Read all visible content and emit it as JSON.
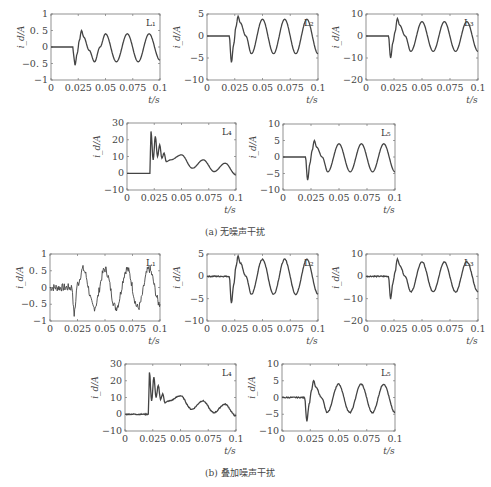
{
  "figure": {
    "caption_a": "(a) 无噪声干扰",
    "caption_b": "(b) 叠加噪声干扰",
    "ylabel": "i_d/A",
    "xlabel": "t/s",
    "x_ticks": [
      "0",
      "0.025",
      "0.05",
      "0.075",
      "0.1"
    ]
  },
  "chart_data": [
    {
      "panel": "a",
      "name": "L1",
      "type": "line",
      "title": "L₁",
      "xlabel": "t/s",
      "ylabel": "i_d/A",
      "xlim": [
        0,
        0.1
      ],
      "ylim": [
        -1,
        1
      ],
      "y_ticks": [
        1,
        0.5,
        0,
        -0.5,
        -1
      ],
      "noise": false,
      "x": [
        0,
        0.02,
        0.021,
        0.022,
        0.024,
        0.026,
        0.028,
        0.03,
        0.035,
        0.04,
        0.045,
        0.05,
        0.06,
        0.07,
        0.08,
        0.09,
        0.1
      ],
      "values": [
        0,
        0,
        -0.3,
        -0.55,
        -0.2,
        0.2,
        0.5,
        0.3,
        -0.1,
        -0.45,
        0.0,
        0.4,
        -0.45,
        0.4,
        -0.45,
        0.4,
        -0.4
      ]
    },
    {
      "panel": "a",
      "name": "L2",
      "type": "line",
      "title": "L₂",
      "xlabel": "t/s",
      "ylabel": "i_d/A",
      "xlim": [
        0,
        0.1
      ],
      "ylim": [
        -10,
        5
      ],
      "y_ticks": [
        5,
        0,
        -5,
        -10
      ],
      "noise": false,
      "x": [
        0,
        0.02,
        0.022,
        0.024,
        0.026,
        0.028,
        0.03,
        0.035,
        0.04,
        0.05,
        0.06,
        0.07,
        0.08,
        0.09,
        0.1
      ],
      "values": [
        0,
        0,
        -6,
        -2,
        2,
        4.5,
        3,
        0,
        -4,
        3.8,
        -4,
        3.8,
        -4,
        3.8,
        -4
      ]
    },
    {
      "panel": "a",
      "name": "L3",
      "type": "line",
      "title": "L₃",
      "xlabel": "t/s",
      "ylabel": "i_d/A",
      "xlim": [
        0,
        0.1
      ],
      "ylim": [
        -20,
        10
      ],
      "y_ticks": [
        10,
        0,
        -10,
        -20
      ],
      "noise": false,
      "x": [
        0,
        0.02,
        0.022,
        0.024,
        0.026,
        0.028,
        0.03,
        0.035,
        0.04,
        0.05,
        0.06,
        0.07,
        0.08,
        0.09,
        0.1
      ],
      "values": [
        0,
        0,
        -10,
        -3,
        2,
        8,
        5,
        0,
        -7,
        6.5,
        -7,
        6.5,
        -7,
        6.5,
        -7
      ]
    },
    {
      "panel": "a",
      "name": "L4",
      "type": "line",
      "title": "L₄",
      "xlabel": "t/s",
      "ylabel": "i_d/A",
      "xlim": [
        0,
        0.1
      ],
      "ylim": [
        -10,
        30
      ],
      "y_ticks": [
        30,
        20,
        10,
        0,
        -10
      ],
      "noise": false,
      "x": [
        0,
        0.021,
        0.022,
        0.024,
        0.026,
        0.028,
        0.03,
        0.032,
        0.034,
        0.036,
        0.04,
        0.05,
        0.06,
        0.07,
        0.08,
        0.09,
        0.1
      ],
      "values": [
        0,
        0,
        25,
        8,
        22,
        10,
        17,
        9,
        12,
        7,
        8,
        11,
        3,
        8,
        1,
        6,
        -1
      ]
    },
    {
      "panel": "a",
      "name": "L5",
      "type": "line",
      "title": "L₅",
      "xlabel": "t/s",
      "ylabel": "i_d/A",
      "xlim": [
        0,
        0.1
      ],
      "ylim": [
        -10,
        10
      ],
      "y_ticks": [
        10,
        5,
        0,
        -5,
        -10
      ],
      "noise": false,
      "x": [
        0,
        0.02,
        0.022,
        0.024,
        0.026,
        0.028,
        0.03,
        0.035,
        0.04,
        0.05,
        0.06,
        0.07,
        0.08,
        0.09,
        0.1
      ],
      "values": [
        0,
        0,
        -7,
        -2,
        2,
        5,
        3,
        0,
        -4.5,
        4,
        -4.5,
        4,
        -4.5,
        4,
        -4.5
      ]
    },
    {
      "panel": "b",
      "name": "L1",
      "type": "line",
      "title": "L₁",
      "xlabel": "t/s",
      "ylabel": "i_d/A",
      "xlim": [
        0,
        0.1
      ],
      "ylim": [
        -1,
        1
      ],
      "y_ticks": [
        1,
        0.5,
        0,
        -0.5,
        -1
      ],
      "noise": true,
      "x": [
        0,
        0.02,
        0.022,
        0.025,
        0.03,
        0.04,
        0.05,
        0.06,
        0.07,
        0.08,
        0.09,
        0.1
      ],
      "values": [
        0,
        0,
        -0.8,
        0.1,
        0.55,
        -0.6,
        0.55,
        -0.6,
        0.55,
        -0.6,
        0.55,
        -0.5
      ]
    },
    {
      "panel": "b",
      "name": "L2",
      "type": "line",
      "title": "L₂",
      "xlabel": "t/s",
      "ylabel": "i_d/A",
      "xlim": [
        0,
        0.1
      ],
      "ylim": [
        -10,
        5
      ],
      "y_ticks": [
        5,
        0,
        -5,
        -10
      ],
      "noise": true,
      "x": [
        0,
        0.02,
        0.022,
        0.024,
        0.026,
        0.028,
        0.03,
        0.035,
        0.04,
        0.05,
        0.06,
        0.07,
        0.08,
        0.09,
        0.1
      ],
      "values": [
        0,
        0,
        -6,
        -2,
        2,
        4.5,
        3,
        0,
        -4,
        3.8,
        -4,
        3.8,
        -4,
        3.8,
        -4
      ]
    },
    {
      "panel": "b",
      "name": "L3",
      "type": "line",
      "title": "L₃",
      "xlabel": "t/s",
      "ylabel": "i_d/A",
      "xlim": [
        0,
        0.1
      ],
      "ylim": [
        -20,
        10
      ],
      "y_ticks": [
        10,
        0,
        -10,
        -20
      ],
      "noise": true,
      "x": [
        0,
        0.02,
        0.022,
        0.024,
        0.026,
        0.028,
        0.03,
        0.035,
        0.04,
        0.05,
        0.06,
        0.07,
        0.08,
        0.09,
        0.1
      ],
      "values": [
        0,
        0,
        -10,
        -3,
        2,
        8,
        5,
        0,
        -7,
        6.5,
        -7,
        6.5,
        -7,
        6.5,
        -7
      ]
    },
    {
      "panel": "b",
      "name": "L4",
      "type": "line",
      "title": "L₄",
      "xlabel": "t/s",
      "ylabel": "i_d/A",
      "xlim": [
        0,
        0.1
      ],
      "ylim": [
        -10,
        30
      ],
      "y_ticks": [
        30,
        20,
        10,
        0,
        -10
      ],
      "noise": true,
      "x": [
        0,
        0.021,
        0.022,
        0.024,
        0.026,
        0.028,
        0.03,
        0.032,
        0.034,
        0.036,
        0.04,
        0.05,
        0.06,
        0.07,
        0.08,
        0.09,
        0.1
      ],
      "values": [
        0,
        0,
        25,
        8,
        22,
        10,
        17,
        9,
        12,
        7,
        8,
        11,
        3,
        8,
        1,
        6,
        -1
      ]
    },
    {
      "panel": "b",
      "name": "L5",
      "type": "line",
      "title": "L₅",
      "xlabel": "t/s",
      "ylabel": "i_d/A",
      "xlim": [
        0,
        0.1
      ],
      "ylim": [
        -10,
        10
      ],
      "y_ticks": [
        10,
        5,
        0,
        -5,
        -10
      ],
      "noise": true,
      "x": [
        0,
        0.02,
        0.022,
        0.024,
        0.026,
        0.028,
        0.03,
        0.035,
        0.04,
        0.05,
        0.06,
        0.07,
        0.08,
        0.09,
        0.1
      ],
      "values": [
        0,
        0,
        -7,
        -2,
        2,
        5,
        3,
        0,
        -4.5,
        4,
        -4.5,
        4,
        -4.5,
        4,
        -4.5
      ]
    }
  ],
  "layout": {
    "axes_boxes": [
      {
        "left": 51,
        "top": 14,
        "width": 109,
        "height": 66
      },
      {
        "left": 207,
        "top": 14,
        "width": 111,
        "height": 66
      },
      {
        "left": 366,
        "top": 14,
        "width": 112,
        "height": 66
      },
      {
        "left": 127,
        "top": 123,
        "width": 109,
        "height": 67
      },
      {
        "left": 283,
        "top": 124,
        "width": 112,
        "height": 66
      },
      {
        "left": 50,
        "top": 254,
        "width": 110,
        "height": 67
      },
      {
        "left": 207,
        "top": 254,
        "width": 111,
        "height": 67
      },
      {
        "left": 366,
        "top": 254,
        "width": 112,
        "height": 67
      },
      {
        "left": 125,
        "top": 364,
        "width": 111,
        "height": 67
      },
      {
        "left": 282,
        "top": 364,
        "width": 113,
        "height": 67
      }
    ]
  }
}
